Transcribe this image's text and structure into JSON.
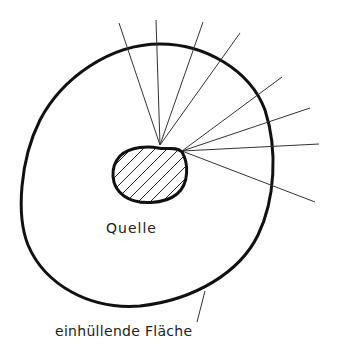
{
  "diagram": {
    "type": "physics-schematic",
    "labels": {
      "source": "Quelle",
      "enclosing_surface": "einhüllende Fläche"
    },
    "colors": {
      "stroke": "#111111",
      "ray": "#333333",
      "text": "#222222",
      "background": "#ffffff"
    },
    "source_blob": {
      "hatched": true,
      "emission_points": [
        [
          160,
          145
        ],
        [
          182,
          151
        ]
      ]
    },
    "rays": [
      {
        "from": [
          160,
          145
        ],
        "to": [
          119,
          23
        ]
      },
      {
        "from": [
          160,
          145
        ],
        "to": [
          156,
          20
        ]
      },
      {
        "from": [
          160,
          145
        ],
        "to": [
          203,
          22
        ]
      },
      {
        "from": [
          160,
          145
        ],
        "to": [
          240,
          33
        ]
      },
      {
        "from": [
          182,
          151
        ],
        "to": [
          282,
          77
        ]
      },
      {
        "from": [
          182,
          151
        ],
        "to": [
          310,
          108
        ]
      },
      {
        "from": [
          182,
          151
        ],
        "to": [
          319,
          144
        ]
      },
      {
        "from": [
          182,
          151
        ],
        "to": [
          315,
          202
        ]
      }
    ],
    "leader_line": {
      "from": [
        205,
        291
      ],
      "to": [
        197,
        322
      ]
    }
  }
}
